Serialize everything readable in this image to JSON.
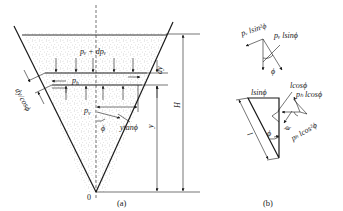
{
  "figure_a": {
    "caption": "(a)",
    "labels": {
      "pv_plus_dpv": "pᵥ + dpᵥ",
      "ph": "p",
      "ph_sub": "h",
      "pv": "p",
      "pv_sub": "v",
      "phi": "ϕ",
      "ytanphi": "ytanϕ",
      "y": "y",
      "H": "H",
      "dy": "dy",
      "dy_cos": "dy/cosϕ",
      "origin": "0"
    }
  },
  "figure_b": {
    "caption": "(b)",
    "labels": {
      "pv_lsin2": "pᵥ lsin²ϕ",
      "pv_lsin": "pᵥ lsinϕ",
      "phi_top": "ϕ",
      "lsin": "lsinϕ",
      "lcos": "lcosϕ",
      "ph_lcos": "pₕ lcosϕ",
      "ph_lcos2": "pₕ lcos²ϕ",
      "phi_mid": "ϕ",
      "phi_small": "ϕ",
      "l": "l"
    }
  }
}
